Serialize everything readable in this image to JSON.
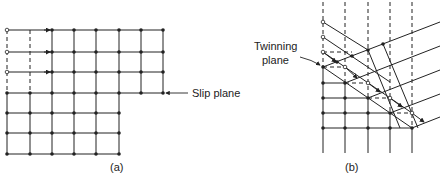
{
  "figure": {
    "panel_a": {
      "caption": "(a)",
      "annotation": "Slip plane"
    },
    "panel_b": {
      "caption": "(b)",
      "annotation_line1": "Twinning",
      "annotation_line2": "plane"
    },
    "colors": {
      "line": "#222222",
      "background": "#ffffff"
    }
  }
}
